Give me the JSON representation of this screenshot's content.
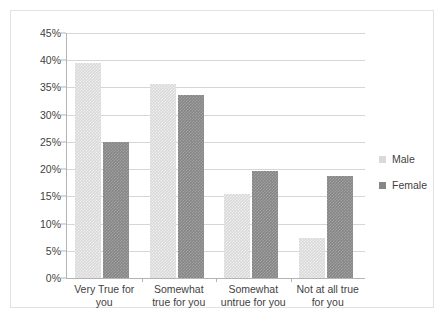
{
  "chart_data": {
    "type": "bar",
    "title": "",
    "subtitle": "",
    "xlabel": "",
    "ylabel": "",
    "categories": [
      "Very True for you",
      "Somewhat true for you",
      "Somewhat untrue for you",
      "Not at all true for you"
    ],
    "category_lines": [
      [
        "Very True for",
        "you"
      ],
      [
        "Somewhat",
        "true for you"
      ],
      [
        "Somewhat",
        "untrue for you"
      ],
      [
        "Not at all true",
        "for you"
      ]
    ],
    "series": [
      {
        "name": "Male",
        "color": "#d9d9d9",
        "values": [
          39.5,
          35.7,
          15.5,
          7.3
        ]
      },
      {
        "name": "Female",
        "color": "#868686",
        "values": [
          25.0,
          33.6,
          19.7,
          18.7
        ]
      }
    ],
    "ylim": [
      0,
      45
    ],
    "ytick_values": [
      0,
      5,
      10,
      15,
      20,
      25,
      30,
      35,
      40,
      45
    ],
    "ytick_labels": [
      "0%",
      "5%",
      "10%",
      "15%",
      "20%",
      "25%",
      "30%",
      "35%",
      "40%",
      "45%"
    ],
    "grid": true,
    "grid_axis": "y",
    "legend_position": "right",
    "value_format": "percent",
    "frame_border_color": "#e2e2e2",
    "axis_color": "#b4b4b4",
    "gridline_color": "#d6d6d6",
    "text_color": "#3f3f3f",
    "background_color": "#ffffff"
  },
  "legend": {
    "items": [
      {
        "label": "Male",
        "swatch_name": "legend-swatch-male"
      },
      {
        "label": "Female",
        "swatch_name": "legend-swatch-female"
      }
    ]
  }
}
